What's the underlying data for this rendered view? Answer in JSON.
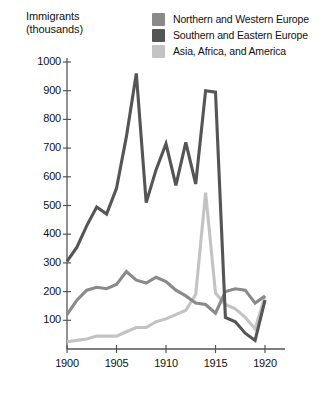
{
  "chart_data": {
    "type": "line",
    "title": "",
    "ylabel_line1": "Immigrants",
    "ylabel_line2": "(thousands)",
    "xlabel": "",
    "x": [
      1900,
      1901,
      1902,
      1903,
      1904,
      1905,
      1906,
      1907,
      1908,
      1909,
      1910,
      1911,
      1912,
      1913,
      1914,
      1915,
      1916,
      1917,
      1918,
      1919,
      1920
    ],
    "xticks": [
      1900,
      1905,
      1910,
      1915,
      1920
    ],
    "xtick_labels": [
      "1900",
      "1905",
      "1910",
      "1915",
      "1920"
    ],
    "yticks": [
      100,
      200,
      300,
      400,
      500,
      600,
      700,
      800,
      900,
      1000
    ],
    "ytick_labels": [
      "100",
      "200",
      "300",
      "400",
      "500",
      "600",
      "700",
      "800",
      "900",
      "1000"
    ],
    "xlim": [
      1900,
      1920
    ],
    "ylim": [
      0,
      1050
    ],
    "grid": false,
    "legend_position": "top-right",
    "series": [
      {
        "name": "Northern and Western Europe",
        "color": "#8a8a8a",
        "values": [
          120,
          170,
          205,
          215,
          210,
          225,
          270,
          240,
          230,
          250,
          235,
          205,
          185,
          160,
          155,
          125,
          200,
          210,
          205,
          160,
          185
        ]
      },
      {
        "name": "Southern and Eastern Europe",
        "color": "#555555",
        "values": [
          305,
          355,
          430,
          495,
          470,
          560,
          740,
          960,
          510,
          625,
          715,
          570,
          720,
          575,
          900,
          895,
          110,
          95,
          55,
          30,
          170
        ]
      },
      {
        "name": "Asia, Africa, and America",
        "color": "#c3c3c3",
        "values": [
          25,
          30,
          35,
          45,
          45,
          45,
          60,
          75,
          75,
          95,
          105,
          120,
          135,
          190,
          545,
          195,
          155,
          140,
          110,
          70,
          185
        ]
      }
    ]
  },
  "legend": {
    "items": [
      {
        "label": "Northern and Western Europe",
        "color": "#8a8a8a"
      },
      {
        "label": "Southern and Eastern Europe",
        "color": "#555555"
      },
      {
        "label": "Asia, Africa, and America",
        "color": "#c3c3c3"
      }
    ]
  },
  "axes": {
    "axis_color": "#555555",
    "y_title": "Immigrants\n(thousands)"
  }
}
